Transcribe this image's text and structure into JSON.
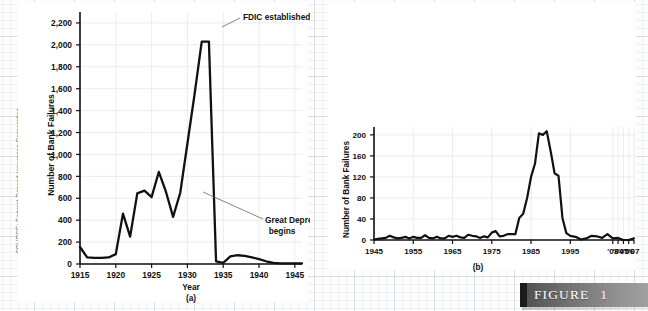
{
  "source_credit": "SOURCE: Federal Deposit Insurance Corporation.",
  "figure": {
    "label": "FIGURE",
    "number": "1"
  },
  "chart_data": [
    {
      "id": "a",
      "type": "line",
      "title": "",
      "panel_label": "(a)",
      "xlabel": "Year",
      "ylabel": "Number of Bank Failures",
      "xlim": [
        1915,
        1946
      ],
      "ylim": [
        0,
        2300
      ],
      "grid": true,
      "legend": "none",
      "xticks": [
        1915,
        1920,
        1925,
        1930,
        1935,
        1940,
        1945
      ],
      "xticklabels": [
        "1915",
        "1920",
        "1925",
        "1930",
        "1935",
        "1940",
        "1945"
      ],
      "yticks": [
        0,
        200,
        400,
        600,
        800,
        1000,
        1200,
        1400,
        1600,
        1800,
        2000,
        2200
      ],
      "yticklabels": [
        "0",
        "200",
        "400",
        "600",
        "800",
        "1,000",
        "1,200",
        "1,400",
        "1,600",
        "1,800",
        "2,000",
        "2,200"
      ],
      "annotations": [
        {
          "text": "FDIC established",
          "x": 1933,
          "y": 2030
        },
        {
          "text": "Great Depression",
          "text2": "begins",
          "x": 1929,
          "y": 650
        }
      ],
      "x": [
        1915,
        1916,
        1917,
        1918,
        1919,
        1920,
        1921,
        1922,
        1923,
        1924,
        1925,
        1926,
        1927,
        1928,
        1929,
        1930,
        1931,
        1932,
        1933,
        1934,
        1935,
        1936,
        1937,
        1938,
        1939,
        1940,
        1941,
        1942,
        1943,
        1944,
        1945,
        1946
      ],
      "values": [
        155,
        60,
        55,
        55,
        60,
        90,
        460,
        250,
        645,
        670,
        610,
        840,
        660,
        430,
        650,
        1100,
        1550,
        2030,
        2030,
        25,
        10,
        70,
        80,
        75,
        60,
        45,
        25,
        10,
        5,
        5,
        5,
        5
      ]
    },
    {
      "id": "b",
      "type": "line",
      "title": "",
      "panel_label": "(b)",
      "xlabel": "",
      "ylabel": "Number of Bank Failures",
      "xlim": [
        1945,
        2007
      ],
      "ylim": [
        0,
        215
      ],
      "grid": true,
      "legend": "none",
      "xticks": [
        1945,
        1955,
        1965,
        1975,
        1985,
        1995,
        2003,
        2004,
        2005,
        2006,
        2007
      ],
      "xticklabels": [
        "1945",
        "1955",
        "1965",
        "1975",
        "1985",
        "1995",
        "'03",
        "'04",
        "'05",
        "'06",
        "'07"
      ],
      "yticks": [
        0,
        40,
        80,
        120,
        160,
        200
      ],
      "yticklabels": [
        "0",
        "40",
        "80",
        "120",
        "160",
        "200"
      ],
      "annotations": [],
      "x": [
        1945,
        1946,
        1947,
        1948,
        1949,
        1950,
        1951,
        1952,
        1953,
        1954,
        1955,
        1956,
        1957,
        1958,
        1959,
        1960,
        1961,
        1962,
        1963,
        1964,
        1965,
        1966,
        1967,
        1968,
        1969,
        1970,
        1971,
        1972,
        1973,
        1974,
        1975,
        1976,
        1977,
        1978,
        1979,
        1980,
        1981,
        1982,
        1983,
        1984,
        1985,
        1986,
        1987,
        1988,
        1989,
        1990,
        1991,
        1992,
        1993,
        1994,
        1995,
        1996,
        1997,
        1998,
        1999,
        2000,
        2001,
        2002,
        2003,
        2004,
        2005,
        2006,
        2007
      ],
      "values": [
        1,
        2,
        3,
        4,
        8,
        5,
        3,
        4,
        6,
        3,
        6,
        4,
        4,
        9,
        4,
        3,
        6,
        3,
        3,
        8,
        6,
        8,
        5,
        4,
        10,
        8,
        7,
        4,
        7,
        5,
        14,
        17,
        7,
        8,
        11,
        11,
        11,
        42,
        50,
        80,
        120,
        145,
        203,
        200,
        207,
        169,
        127,
        122,
        42,
        13,
        8,
        6,
        1,
        3,
        8,
        7,
        4,
        11,
        3,
        4,
        0,
        0,
        3
      ]
    }
  ]
}
